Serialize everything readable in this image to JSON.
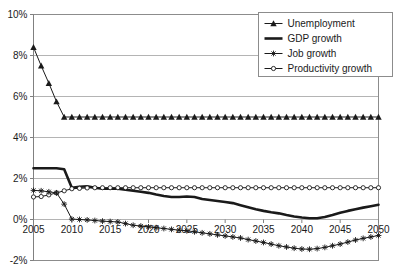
{
  "chart_data": {
    "type": "line",
    "title": "",
    "subtitle": "",
    "xlabel": "",
    "ylabel": "",
    "xlim": [
      2005,
      2050
    ],
    "ylim": [
      -2,
      10
    ],
    "ytick_labels": [
      "10%",
      "8%",
      "6%",
      "4%",
      "2%",
      "0%",
      "-2%"
    ],
    "ytick_values": [
      10,
      8,
      6,
      4,
      2,
      0,
      -2
    ],
    "xtick_labels": [
      "2005",
      "2010",
      "2015",
      "2020",
      "2025",
      "2030",
      "2035",
      "2040",
      "2045",
      "2050"
    ],
    "xtick_values": [
      2005,
      2010,
      2015,
      2020,
      2025,
      2030,
      2035,
      2040,
      2045,
      2050
    ],
    "grid": "horizontal",
    "legend_position": "top-right",
    "y_unit": "percent",
    "x": [
      2005,
      2006,
      2007,
      2008,
      2009,
      2010,
      2011,
      2012,
      2013,
      2014,
      2015,
      2016,
      2017,
      2018,
      2019,
      2020,
      2021,
      2022,
      2023,
      2024,
      2025,
      2026,
      2027,
      2028,
      2029,
      2030,
      2031,
      2032,
      2033,
      2034,
      2035,
      2036,
      2037,
      2038,
      2039,
      2040,
      2041,
      2042,
      2043,
      2044,
      2045,
      2046,
      2047,
      2048,
      2049,
      2050
    ],
    "series": [
      {
        "name": "Unemployment",
        "marker": "triangle",
        "line_width": "thin",
        "values": [
          8.4,
          7.5,
          6.65,
          5.75,
          5.0,
          5.0,
          5.0,
          5.0,
          5.0,
          5.0,
          5.0,
          5.0,
          5.0,
          5.0,
          5.0,
          5.0,
          5.0,
          5.0,
          5.0,
          5.0,
          5.0,
          5.0,
          5.0,
          5.0,
          5.0,
          5.0,
          5.0,
          5.0,
          5.0,
          5.0,
          5.0,
          5.0,
          5.0,
          5.0,
          5.0,
          5.0,
          5.0,
          5.0,
          5.0,
          5.0,
          5.0,
          5.0,
          5.0,
          5.0,
          5.0,
          5.0
        ]
      },
      {
        "name": "GDP growth",
        "marker": "none",
        "line_width": "thick",
        "values": [
          2.5,
          2.5,
          2.5,
          2.5,
          2.45,
          1.55,
          1.6,
          1.62,
          1.55,
          1.5,
          1.5,
          1.5,
          1.45,
          1.4,
          1.35,
          1.3,
          1.22,
          1.15,
          1.1,
          1.1,
          1.12,
          1.1,
          1.0,
          0.95,
          0.9,
          0.85,
          0.8,
          0.7,
          0.6,
          0.5,
          0.42,
          0.35,
          0.3,
          0.22,
          0.15,
          0.1,
          0.06,
          0.06,
          0.12,
          0.22,
          0.33,
          0.42,
          0.5,
          0.58,
          0.65,
          0.72
        ]
      },
      {
        "name": "Job growth",
        "marker": "star",
        "line_width": "thin",
        "values": [
          1.42,
          1.4,
          1.35,
          1.3,
          0.75,
          0.02,
          0.0,
          -0.02,
          -0.05,
          -0.08,
          -0.1,
          -0.12,
          -0.2,
          -0.28,
          -0.32,
          -0.36,
          -0.4,
          -0.44,
          -0.48,
          -0.52,
          -0.55,
          -0.6,
          -0.65,
          -0.7,
          -0.75,
          -0.8,
          -0.85,
          -0.9,
          -0.98,
          -1.05,
          -1.12,
          -1.2,
          -1.28,
          -1.34,
          -1.4,
          -1.44,
          -1.45,
          -1.42,
          -1.36,
          -1.28,
          -1.2,
          -1.1,
          -1.0,
          -0.92,
          -0.85,
          -0.78
        ]
      },
      {
        "name": "Productivity growth",
        "marker": "circle",
        "line_width": "thin",
        "values": [
          1.1,
          1.12,
          1.2,
          1.3,
          1.4,
          1.5,
          1.52,
          1.54,
          1.55,
          1.55,
          1.55,
          1.55,
          1.55,
          1.55,
          1.55,
          1.55,
          1.55,
          1.55,
          1.55,
          1.55,
          1.55,
          1.55,
          1.55,
          1.55,
          1.55,
          1.55,
          1.55,
          1.55,
          1.55,
          1.55,
          1.55,
          1.55,
          1.55,
          1.55,
          1.55,
          1.55,
          1.55,
          1.55,
          1.55,
          1.55,
          1.55,
          1.55,
          1.55,
          1.55,
          1.55,
          1.55
        ]
      }
    ]
  },
  "legend": {
    "items": [
      {
        "label": "Unemployment"
      },
      {
        "label": "GDP growth"
      },
      {
        "label": "Job growth"
      },
      {
        "label": "Productivity growth"
      }
    ]
  }
}
